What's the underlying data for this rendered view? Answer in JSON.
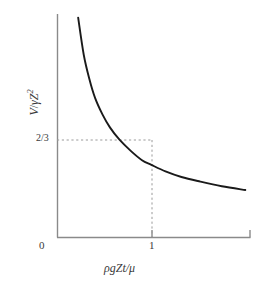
{
  "chart_data": {
    "type": "line",
    "title": "",
    "subtitle": "",
    "xlabel": "ρgZt/μ",
    "ylabel": "V/γZ²",
    "xlim": [
      0,
      2.05
    ],
    "ylim": [
      0,
      2.4
    ],
    "grid": false,
    "legend": null,
    "xticks": [
      {
        "value": 0,
        "label": "0"
      },
      {
        "value": 1,
        "label": "1"
      }
    ],
    "yticks": [
      {
        "value": 0.6667,
        "label": "2/3"
      }
    ],
    "annotations": [
      {
        "name": "guide-lines",
        "style": "dashed",
        "description": "dashed guide lines from y axis at 2/3 to the curve at x = 1 and down to the x axis",
        "point": {
          "x": 1,
          "y": 0.6667
        }
      }
    ],
    "series": [
      {
        "name": "V/γZ² vs ρgZt/μ",
        "color": "#1a1a1a",
        "x": [
          0.22,
          0.28,
          0.34,
          0.4,
          0.48,
          0.56,
          0.66,
          0.78,
          0.9,
          1.0,
          1.15,
          1.32,
          1.52,
          1.75,
          2.0
        ],
        "values": [
          2.36,
          1.96,
          1.7,
          1.5,
          1.32,
          1.18,
          1.05,
          0.93,
          0.83,
          0.78,
          0.71,
          0.65,
          0.6,
          0.55,
          0.51
        ]
      }
    ]
  },
  "axes": {
    "xaxis_title": "ρgZt/μ",
    "yaxis_title_numerator": "V",
    "yaxis_title_denominator": "γZ",
    "yaxis_title_exponent": "2",
    "xtick_zero": "0",
    "xtick_one": "1",
    "ytick_two_thirds": "2/3"
  },
  "colors": {
    "curve": "#1a1a1a",
    "axis": "#8a8a8a",
    "dash": "#9a9a9a",
    "text": "#3a3a3a",
    "background": "#ffffff"
  }
}
